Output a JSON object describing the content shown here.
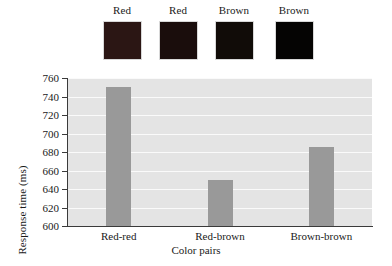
{
  "swatches": [
    {
      "label": "Red",
      "color": "#2b1614",
      "name": "swatch-red-1"
    },
    {
      "label": "Red",
      "color": "#1a0d0c",
      "name": "swatch-red-2"
    },
    {
      "label": "Brown",
      "color": "#110c08",
      "name": "swatch-brown-1"
    },
    {
      "label": "Brown",
      "color": "#050403",
      "name": "swatch-brown-2"
    }
  ],
  "chart_data": {
    "type": "bar",
    "title": "",
    "subtitle": "",
    "categories": [
      "Red-red",
      "Red-brown",
      "Brown-brown"
    ],
    "values": [
      750,
      650,
      686
    ],
    "xlabel": "Color pairs",
    "ylabel": "Response time (ms)",
    "ylim": [
      600,
      760
    ],
    "ytick_step": 20,
    "yticks": [
      600,
      620,
      640,
      660,
      680,
      700,
      720,
      740,
      760
    ],
    "ytick_labels": [
      "600",
      "620",
      "640",
      "660",
      "680",
      "700",
      "720",
      "740",
      "760"
    ],
    "grid": true,
    "grid_axis": "y",
    "legend": false,
    "bar_color": "#999999",
    "plot_background": "#e4e4e4",
    "gridline_color": "#fafafa",
    "axis_color": "#3a3a3a"
  }
}
